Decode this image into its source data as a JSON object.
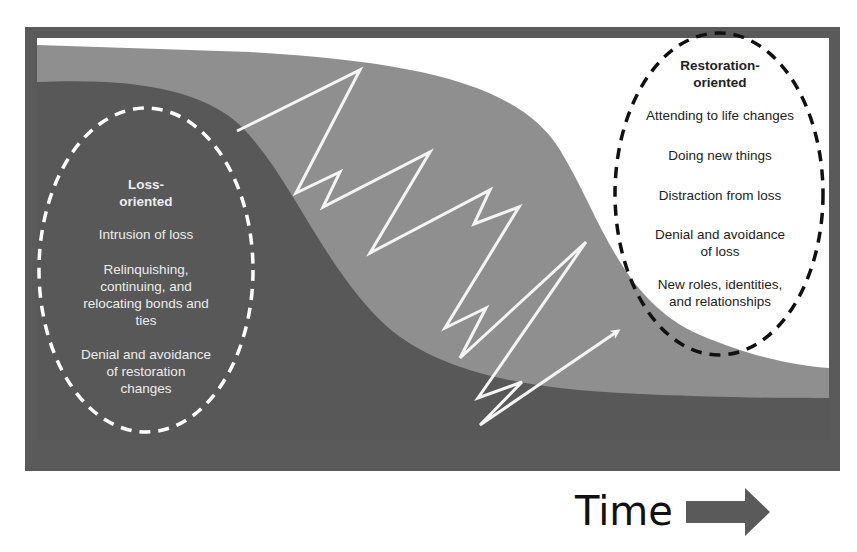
{
  "diagram": {
    "colors": {
      "frame": "#5a5a5a",
      "loss_region": "#585858",
      "oscillation_region": "#8f8f8f",
      "restoration_region": "#ffffff",
      "loss_ellipse_stroke": "#ffffff",
      "restoration_ellipse_stroke": "#111111",
      "zigzag": "#f4f4f4",
      "time_arrow": "#5a5a5a"
    },
    "loss_oriented": {
      "title_line1": "Loss-",
      "title_line2": "oriented",
      "items": [
        {
          "lines": [
            "Intrusion of loss"
          ]
        },
        {
          "lines": [
            "Relinquishing,",
            "continuing, and",
            "relocating bonds and",
            "ties"
          ]
        },
        {
          "lines": [
            "Denial and avoidance",
            "of restoration",
            "changes"
          ]
        }
      ]
    },
    "restoration_oriented": {
      "title_line1": "Restoration-",
      "title_line2": "oriented",
      "items": [
        {
          "lines": [
            "Attending to life changes"
          ]
        },
        {
          "lines": [
            "Doing new things"
          ]
        },
        {
          "lines": [
            "Distraction from loss"
          ]
        },
        {
          "lines": [
            "Denial and avoidance",
            "of loss"
          ]
        },
        {
          "lines": [
            "New roles, identities,",
            "and relationships"
          ]
        }
      ]
    },
    "oscillation_path": "237,131 360,70 296,193 340,172 323,207 430,152 370,253 490,190 474,224 519,207 445,328 486,308 460,358 586,242 478,398 522,382 480,425 618,331",
    "axis": {
      "label": "Time",
      "arrow_icon": "right-arrow"
    }
  }
}
